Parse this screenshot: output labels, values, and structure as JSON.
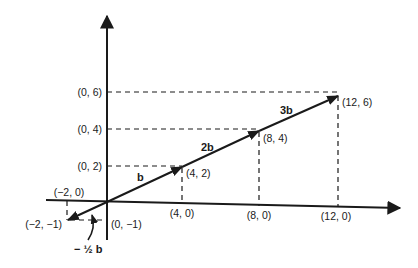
{
  "diagram": {
    "axes": {
      "x_ticks": [
        {
          "label": "(4, 0)"
        },
        {
          "label": "(8, 0)"
        },
        {
          "label": "(12, 0)"
        }
      ],
      "y_ticks": [
        {
          "label": "(0, 2)"
        },
        {
          "label": "(0, 4)"
        },
        {
          "label": "(0, 6)"
        }
      ],
      "neg_x_label": "(−2, 0)",
      "neg_y_label": "(0, −1)"
    },
    "points": [
      {
        "label": "(4, 2)"
      },
      {
        "label": "(8, 4)"
      },
      {
        "label": "(12, 6)"
      },
      {
        "label": "(−2, −1)"
      }
    ],
    "vectors": [
      {
        "label": "b"
      },
      {
        "label": "2b"
      },
      {
        "label": "3b"
      },
      {
        "label": "− ½ b"
      }
    ],
    "colors": {
      "ink": "#1a1a1a",
      "background": "#ffffff"
    }
  }
}
